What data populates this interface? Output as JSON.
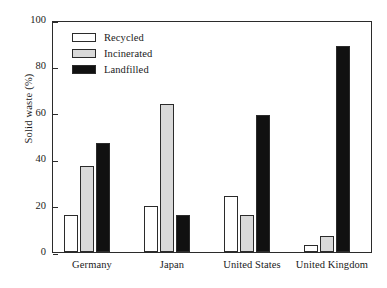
{
  "chart_data": {
    "type": "bar",
    "title": "",
    "xlabel": "",
    "ylabel": "Solid waste (%)",
    "ylim": [
      0,
      100
    ],
    "yticks": [
      0,
      20,
      40,
      60,
      80,
      100
    ],
    "ytick_labels": [
      "0",
      "20",
      "40",
      "60",
      "80",
      "100"
    ],
    "grid": false,
    "legend_position": "upper left",
    "categories": [
      "Germany",
      "Japan",
      "United States",
      "United Kingdom"
    ],
    "series": [
      {
        "name": "Recycled",
        "color": "#ffffff",
        "values": [
          16,
          20,
          24,
          3
        ]
      },
      {
        "name": "Incinerated",
        "color": "#d9d9d9",
        "values": [
          37,
          64,
          16,
          7
        ]
      },
      {
        "name": "Landfilled",
        "color": "#111111",
        "values": [
          47,
          16,
          59,
          89
        ]
      }
    ]
  }
}
